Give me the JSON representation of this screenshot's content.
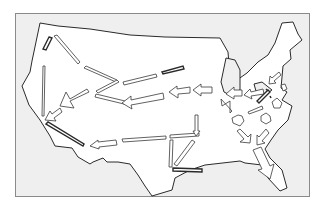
{
  "map": {
    "subject": "United States migration flows",
    "colors": {
      "background": "#efefef",
      "land": "#ffffff",
      "outline": "#2a2a2a",
      "frame": "#8a8a8a"
    },
    "land_outline": "40,23 58,26 90,29 130,35 165,37 220,38 228,52 230,77 237,80 247,73 258,62 268,55 275,43 282,23 293,22 298,34 302,40 290,50 291,59 283,66 281,88 287,92 282,100 292,106 288,120 278,130 271,140 265,149 270,158 282,170 287,188 280,191 268,178 262,165 245,163 240,161 205,165 190,170 175,178 172,190 152,196 145,186 138,175 130,164 118,162 107,162 103,158 93,162 90,164 78,157 72,148 55,146 50,136 40,120 29,105 22,86 30,72 32,61 40,23",
    "lakes": [
      "221,82 226,58 235,60 240,70 240,90 230,95 224,92",
      "254,84 262,82 272,90 266,94 256,91"
    ],
    "arrows": [
      {
        "type": "bar",
        "points": "43,66 45,66 44,116 42,116"
      },
      {
        "type": "bar-dark",
        "points": "49,37 52,38 46,50 43,49"
      },
      {
        "type": "bar",
        "points": "54,36 57,35 80,62 78,64"
      },
      {
        "type": "bar",
        "points": "84,68 86,66 117,80 116,82"
      },
      {
        "type": "bar",
        "points": "117,80 119,82 98,93 96,91"
      },
      {
        "type": "bar",
        "points": "123,82 156,74 157,77 124,85"
      },
      {
        "type": "bar-dark",
        "points": "162,72 183,66 184,69 163,74"
      },
      {
        "type": "bar",
        "points": "96,94 125,101 124,104 95,97"
      },
      {
        "type": "block",
        "points": "89,92 70,101 74,108 60,106 66,92 70,99 87,89"
      },
      {
        "type": "block",
        "points": "163,93 131,100 131,96 122,103 132,109 131,105 164,99"
      },
      {
        "type": "block",
        "points": "190,87 177,89 177,86 169,92 178,98 178,94 190,93"
      },
      {
        "type": "block",
        "points": "212,87 201,87 201,84 193,90 201,96 201,93 212,93"
      },
      {
        "type": "block",
        "points": "60,108 52,114 50,111 45,120 56,121 54,118 62,112"
      },
      {
        "type": "bar-dark",
        "points": "46,124 48,122 84,144 83,146"
      },
      {
        "type": "block",
        "points": "116,140 98,142 98,140 90,146 99,149 99,147 117,145"
      },
      {
        "type": "bar",
        "points": "122,139 166,136 166,139 123,142"
      },
      {
        "type": "bar",
        "points": "170,135 199,133 199,136 170,138"
      },
      {
        "type": "bar",
        "points": "195,115 198,115 198,131 200,131 196,136 193,131 195,131"
      },
      {
        "type": "bar",
        "points": "170,140 173,140 172,167 169,167"
      },
      {
        "type": "bar",
        "points": "192,140 195,142 177,166 174,164"
      },
      {
        "type": "bar-dark",
        "points": "173,168 202,169 202,172 173,171"
      },
      {
        "type": "block",
        "points": "221,99 232,111 230,113 230,101 222,106"
      },
      {
        "type": "block",
        "points": "242,90 234,90 234,87 226,94 234,99 234,96 242,96"
      },
      {
        "type": "block",
        "points": "263,89 251,92 250,89 244,95 252,99 251,96 264,94"
      },
      {
        "type": "bar-dark",
        "points": "268,90 270,92 259,103 257,101"
      },
      {
        "type": "bar",
        "points": "248,112 262,106 263,109 249,114"
      },
      {
        "type": "block",
        "points": "238,115 232,118 233,123 240,126 244,121 242,116"
      },
      {
        "type": "block",
        "points": "266,113 261,116 261,121 266,124 271,121 270,116"
      },
      {
        "type": "block",
        "points": "279,72 272,78 270,76 269,84 276,83 274,81 281,75"
      },
      {
        "type": "block",
        "points": "277,98 272,102 274,108 280,108 282,103"
      },
      {
        "type": "block",
        "points": "237,131 244,139 240,142 250,143 251,134 248,137 240,129"
      },
      {
        "type": "block",
        "points": "266,129 259,137 257,135 257,145 265,143 262,141 269,133"
      },
      {
        "type": "block",
        "points": "253,150 261,147 270,166 274,164 270,179 258,170 262,169"
      },
      {
        "type": "small",
        "points": "281,85 285,84 287,89 283,91"
      },
      {
        "type": "dots",
        "points": "266,89 268,91 270,96 271,98"
      }
    ]
  }
}
